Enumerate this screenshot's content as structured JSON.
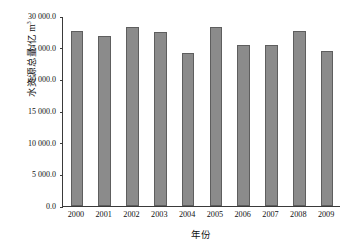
{
  "chart_data": {
    "type": "bar",
    "title": "",
    "xlabel": "年份",
    "ylabel_text": "水资源总量/亿 m",
    "ylabel_superscript": "3",
    "categories": [
      "2000",
      "2001",
      "2002",
      "2003",
      "2004",
      "2005",
      "2006",
      "2007",
      "2008",
      "2009"
    ],
    "values": [
      27700,
      26900,
      28300,
      27500,
      24130,
      28200,
      25500,
      25400,
      27700,
      24500
    ],
    "ylim": [
      0,
      30000
    ],
    "ytick_values": [
      0,
      5000,
      10000,
      15000,
      20000,
      25000,
      30000
    ],
    "ytick_labels": [
      "0.0",
      "5 000.0",
      "10 000.0",
      "15 000.0",
      "20 000.0",
      "25 000.0",
      "30 000.0"
    ],
    "grid": false,
    "legend": null,
    "series": [
      {
        "name": "水资源总量",
        "values": [
          27700,
          26900,
          28300,
          27500,
          24130,
          28200,
          25500,
          25400,
          27700,
          24500
        ]
      }
    ],
    "bar_color": "#8b8b8b",
    "bar_edge_color": "#5e5e5e",
    "axis_color": "#3a3a3a"
  }
}
